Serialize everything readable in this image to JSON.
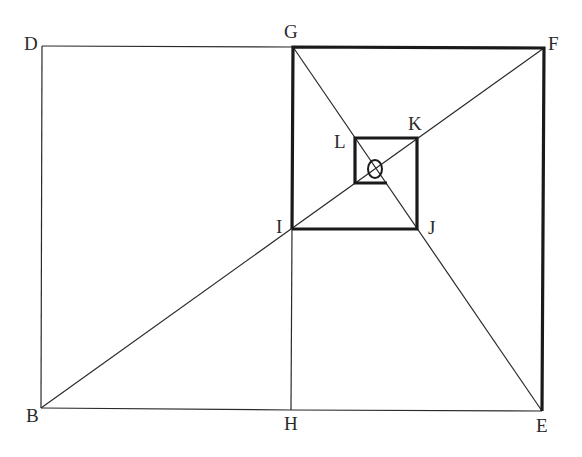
{
  "diagram": {
    "title": "",
    "points": {
      "D": {
        "label": "D",
        "x": 42,
        "y": 46
      },
      "G": {
        "label": "G",
        "x": 293,
        "y": 47
      },
      "F": {
        "label": "F",
        "x": 544,
        "y": 48
      },
      "B": {
        "label": "B",
        "x": 41,
        "y": 408
      },
      "H": {
        "label": "H",
        "x": 291,
        "y": 410
      },
      "E": {
        "label": "E",
        "x": 542,
        "y": 411
      },
      "I": {
        "label": "I",
        "x": 292,
        "y": 229
      },
      "J": {
        "label": "J",
        "x": 417,
        "y": 229
      },
      "K": {
        "label": "K",
        "x": 417,
        "y": 138
      },
      "L": {
        "label": "L",
        "x": 355,
        "y": 138
      },
      "O": {
        "label": "O",
        "x": 375,
        "y": 169
      }
    },
    "labels": {
      "D": "D",
      "G": "G",
      "F": "F",
      "B": "B",
      "H": "H",
      "E": "E",
      "I": "I",
      "J": "J",
      "K": "K",
      "L": "L",
      "O": "O"
    },
    "thin_segments": [
      [
        "D",
        "G"
      ],
      [
        "D",
        "B"
      ],
      [
        "B",
        "H"
      ],
      [
        "H",
        "E"
      ],
      [
        "G",
        "H"
      ],
      [
        "B",
        "F"
      ],
      [
        "G",
        "E"
      ]
    ],
    "thick_polylines": [
      [
        "I",
        "G",
        "F",
        "E"
      ],
      [
        "J",
        "I"
      ],
      [
        "J",
        "K"
      ],
      [
        "K",
        "L"
      ],
      [
        "L",
        "small_bl",
        "small_br"
      ]
    ],
    "extra_points": {
      "small_bl": {
        "x": 355,
        "y": 183
      },
      "small_br": {
        "x": 387,
        "y": 183
      }
    },
    "colors": {
      "line": "#2a2a2a",
      "thick_line": "#1a1a1a",
      "background": "#ffffff"
    }
  }
}
